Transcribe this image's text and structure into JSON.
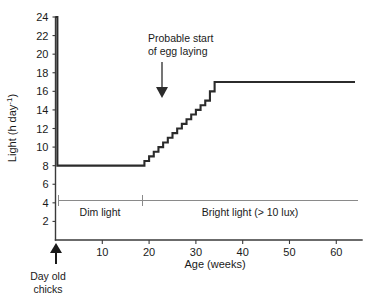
{
  "chart_data": {
    "type": "line",
    "title": "",
    "xlabel": "Age (weeks)",
    "ylabel": "Light (h day",
    "ylabel_sup": "-1",
    "ylabel_tail": ")",
    "xlim": [
      0,
      64
    ],
    "ylim": [
      0,
      24
    ],
    "grid": false,
    "legend": "none",
    "xticks": [
      10,
      20,
      30,
      40,
      50,
      60
    ],
    "xtick_labels": [
      "10",
      "20",
      "30",
      "40",
      "50",
      "60"
    ],
    "yticks": [
      2,
      4,
      6,
      8,
      10,
      12,
      14,
      16,
      18,
      20,
      22,
      24
    ],
    "ytick_labels": [
      "2",
      "4",
      "6",
      "8",
      "10",
      "12",
      "14",
      "16",
      "18",
      "20",
      "22",
      "24"
    ],
    "series": [
      {
        "name": "Lighting programme",
        "step": "post",
        "x": [
          0,
          0.4,
          18,
          19,
          20,
          21,
          22,
          23,
          24,
          25,
          26,
          27,
          28,
          29,
          30,
          31,
          32,
          33,
          34,
          64
        ],
        "values": [
          24,
          8,
          8,
          8.5,
          9,
          9.5,
          10,
          10.5,
          11,
          11.5,
          12,
          12.5,
          13,
          13.5,
          14,
          14.5,
          15,
          16,
          17,
          17
        ]
      }
    ],
    "annotations": [
      {
        "name": "egg-laying",
        "lines": [
          "Probable start",
          "of egg laying"
        ],
        "text_x": 21,
        "text_y": 22.4,
        "arrow_from_x": 21,
        "arrow_from_y": 20.3,
        "arrow_to_x": 21,
        "arrow_to_y": 16.6
      },
      {
        "name": "day-old-chicks",
        "lines": [
          "Day old",
          "chicks"
        ],
        "point_x": 0,
        "arrow": "up"
      }
    ],
    "regimes": [
      {
        "label": "Dim light",
        "from": 0,
        "to": 18
      },
      {
        "label": "Bright light (> 10 lux)",
        "from": 18,
        "to": 64
      }
    ]
  }
}
